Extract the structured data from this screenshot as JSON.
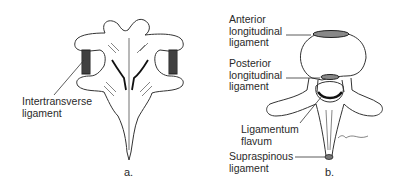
{
  "figure": {
    "panel_a": {
      "caption": "a.",
      "labels": [
        {
          "id": "intertransverse",
          "text": "Intertransverse\nligament"
        }
      ]
    },
    "panel_b": {
      "caption": "b.",
      "labels": [
        {
          "id": "anterior_longitudinal",
          "text": "Anterior\nlongitudinal\nligament"
        },
        {
          "id": "posterior_longitudinal",
          "text": "Posterior\nlongitudinal\nligament"
        },
        {
          "id": "ligamentum_flavum",
          "text": "Ligamentum\nflavum"
        },
        {
          "id": "supraspinous",
          "text": "Supraspinous\nligament"
        }
      ]
    }
  }
}
